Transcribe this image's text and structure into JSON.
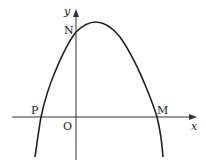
{
  "figure": {
    "type": "parabola-graph",
    "axes": {
      "x_label": "x",
      "y_label": "y",
      "origin_label": "O"
    },
    "points": [
      {
        "label": "N",
        "description": "y-intercept of parabola"
      },
      {
        "label": "P",
        "description": "left x-intercept of parabola"
      },
      {
        "label": "M",
        "description": "right x-intercept of parabola"
      }
    ],
    "colors": {
      "curve": "#222222",
      "axes": "#333333",
      "background": "#ffffff"
    }
  }
}
